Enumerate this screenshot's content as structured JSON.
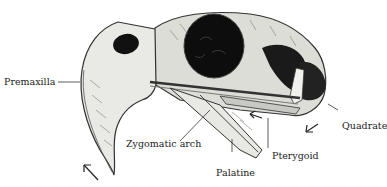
{
  "figure": {
    "labels": {
      "premaxilla": "Premaxilla",
      "zygomatic_arch": "Zygomatic arch",
      "palatine": "Palatine",
      "pterygoid": "Pterygoid",
      "quadrate": "Quadrate"
    },
    "arrows": [
      "beak-tip-arrow-up-left",
      "jugal-arrow-left",
      "quadrate-arrow-down-left"
    ]
  }
}
